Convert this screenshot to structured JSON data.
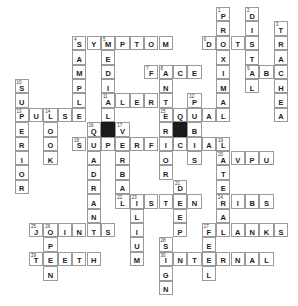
{
  "puzzle": {
    "type": "crossword",
    "cell_size": 14.4,
    "origin": {
      "x": 14.5,
      "y": 7
    },
    "entries": [
      {
        "num": 1,
        "dir": "down",
        "answer": "PROXIMAL",
        "row": 0,
        "col": 14
      },
      {
        "num": 2,
        "dir": "down",
        "answer": "DISTAL",
        "row": 0,
        "col": 16
      },
      {
        "num": 3,
        "dir": "down",
        "answer": "TRACHEA",
        "row": 1,
        "col": 18
      },
      {
        "num": 4,
        "dir": "across",
        "answer": "SYMPTOM",
        "row": 2,
        "col": 4
      },
      {
        "num": 4,
        "dir": "down",
        "answer": "SAMPLE",
        "row": 2,
        "col": 4
      },
      {
        "num": 5,
        "dir": "down",
        "answer": "MEDIAL",
        "row": 2,
        "col": 6
      },
      {
        "num": 6,
        "dir": "across",
        "answer": "DOTS",
        "row": 2,
        "col": 13
      },
      {
        "num": 7,
        "dir": "across",
        "answer": "FACE",
        "row": 4,
        "col": 9
      },
      {
        "num": 8,
        "dir": "down",
        "answer": "ANTERIOR",
        "row": 4,
        "col": 10
      },
      {
        "num": 9,
        "dir": "across",
        "answer": "ABC",
        "row": 4,
        "col": 16
      },
      {
        "num": 10,
        "dir": "down",
        "answer": "SUPERIOR",
        "row": 5,
        "col": 0
      },
      {
        "num": 11,
        "dir": "across",
        "answer": "ALERT",
        "row": 6,
        "col": 6
      },
      {
        "num": 12,
        "dir": "down",
        "answer": "PUBIS",
        "row": 6,
        "col": 12
      },
      {
        "num": 13,
        "dir": "across",
        "answer": "PULSE",
        "row": 7,
        "col": 0
      },
      {
        "num": 14,
        "dir": "down",
        "answer": "LOOK",
        "row": 7,
        "col": 2
      },
      {
        "num": 15,
        "dir": "across",
        "answer": "EQUAL",
        "row": 7,
        "col": 10
      },
      {
        "num": 16,
        "dir": "down",
        "answer": "QUADRANT",
        "row": 8,
        "col": 5
      },
      {
        "num": 17,
        "dir": "down",
        "answer": "VERBAL",
        "row": 8,
        "col": 7
      },
      {
        "num": 18,
        "dir": "across",
        "answer": "SUPERFICIAL",
        "row": 9,
        "col": 4
      },
      {
        "num": 19,
        "dir": "down",
        "answer": "LATERAL",
        "row": 9,
        "col": 14
      },
      {
        "num": 20,
        "dir": "across",
        "answer": "AVPU",
        "row": 10,
        "col": 14
      },
      {
        "num": 21,
        "dir": "down",
        "answer": "DEEP",
        "row": 12,
        "col": 11
      },
      {
        "num": 22,
        "dir": "across",
        "answer": "LISTEN",
        "row": 13,
        "col": 7
      },
      {
        "num": 23,
        "dir": "down",
        "answer": "ILIUM",
        "row": 13,
        "col": 8
      },
      {
        "num": 24,
        "dir": "across",
        "answer": "RIBS",
        "row": 13,
        "col": 14
      },
      {
        "num": 25,
        "dir": "across",
        "answer": "JOINTS",
        "row": 15,
        "col": 1
      },
      {
        "num": 26,
        "dir": "down",
        "answer": "OPEN",
        "row": 15,
        "col": 2
      },
      {
        "num": 27,
        "dir": "across",
        "answer": "FLANKS",
        "row": 15,
        "col": 13
      },
      {
        "num": 27,
        "dir": "down",
        "answer": "FEEL",
        "row": 15,
        "col": 13
      },
      {
        "num": 28,
        "dir": "down",
        "answer": "SIGN",
        "row": 16,
        "col": 10
      },
      {
        "num": 29,
        "dir": "across",
        "answer": "TEETH",
        "row": 17,
        "col": 1
      },
      {
        "num": 30,
        "dir": "across",
        "answer": "INTERNAL",
        "row": 17,
        "col": 10
      }
    ],
    "black_cells": [
      {
        "row": 8,
        "col": 6
      },
      {
        "row": 8,
        "col": 11
      }
    ],
    "colors": {
      "border": "#9a9a9a",
      "black": "#1a1a1a",
      "text": "#222222"
    }
  }
}
